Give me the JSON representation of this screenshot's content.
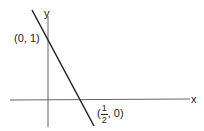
{
  "axes": {
    "x_label": "x",
    "y_label": "y"
  },
  "points": {
    "y_intercept": "(0, 1)",
    "x_intercept": {
      "open": "(",
      "numerator": "1",
      "denominator": "2",
      "rest": ", 0)"
    }
  },
  "colors": {
    "line": "#222222",
    "axis": "#666666"
  }
}
